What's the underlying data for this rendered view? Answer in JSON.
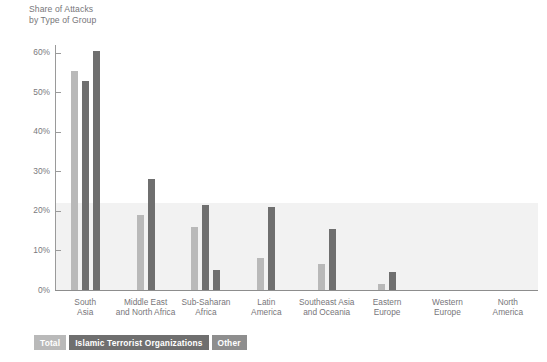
{
  "chart_data": {
    "type": "bar",
    "title": "Share of Attacks\nby Type of Group",
    "xlabel": "",
    "ylabel": "",
    "ylim": [
      0,
      62
    ],
    "grid": false,
    "legend_position": "bottom-left",
    "tick_labels": [
      "60%",
      "50%",
      "40%",
      "30%",
      "20%",
      "10%",
      "0%"
    ],
    "tick_values": [
      60,
      50,
      40,
      30,
      20,
      10,
      0
    ],
    "categories": [
      "South\nAsia",
      "Middle East\nand North Africa",
      "Sub-Saharan\nAfrica",
      "Latin\nAmerica",
      "Southeast Asia\nand Oceania",
      "Eastern\nEurope",
      "Western\nEurope",
      "North\nAmerica"
    ],
    "series": [
      {
        "name": "Total",
        "color": "#b9b9b9",
        "values": [
          55.5,
          19.0,
          16.0,
          8.0,
          6.5,
          1.5,
          0,
          0
        ]
      },
      {
        "name": "Islamic Terrorist Organizations",
        "color": "#6f6f6f",
        "values": [
          53.0,
          28.0,
          21.5,
          21.0,
          15.5,
          4.5,
          0,
          0
        ]
      },
      {
        "name": "Other",
        "color": "#6f6f6f",
        "values": [
          60.5,
          0,
          5.0,
          0,
          0,
          0,
          0,
          0
        ]
      }
    ]
  },
  "legend": {
    "items": [
      {
        "label": "Total",
        "color": "#b9b9b9"
      },
      {
        "label": "Islamic Terrorist Organizations",
        "color": "#6f6f6f"
      },
      {
        "label": "Other",
        "color": "#8e8e8e"
      }
    ]
  }
}
